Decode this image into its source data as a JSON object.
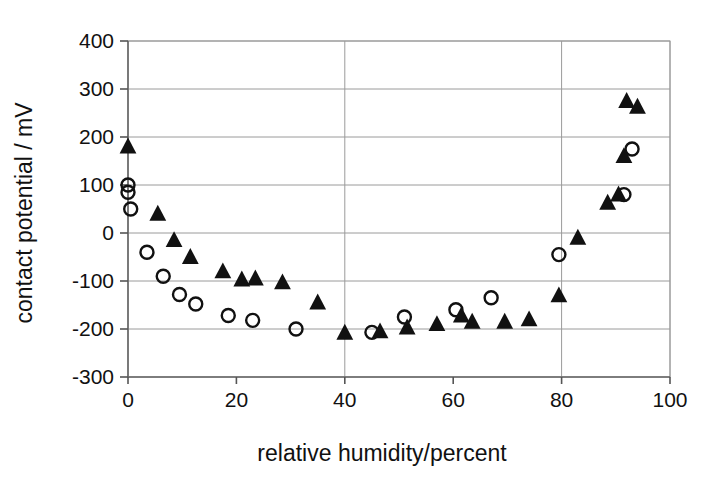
{
  "chart_data": {
    "type": "scatter",
    "title": "",
    "xlabel": "relative humidity/percent",
    "ylabel": "contact potential / mV",
    "xlim": [
      0,
      100
    ],
    "ylim": [
      -300,
      400
    ],
    "xticks": [
      0,
      20,
      40,
      60,
      80,
      100
    ],
    "yticks": [
      -300,
      -200,
      -100,
      0,
      100,
      200,
      300,
      400
    ],
    "xtick_labels": [
      "0",
      "20",
      "40",
      "60",
      "80",
      "100"
    ],
    "ytick_labels": [
      "-300",
      "-200",
      "-100",
      "0",
      "100",
      "200",
      "300",
      "400"
    ],
    "grid": true,
    "grid_axis": "y",
    "legend": "none",
    "legend_position": "none",
    "annotations": [],
    "series": [
      {
        "name": "open-circles",
        "marker": "open-circle",
        "marker_size": 13,
        "color": "#111111",
        "points": [
          {
            "x": 0.0,
            "y": 100
          },
          {
            "x": 0.0,
            "y": 85
          },
          {
            "x": 0.5,
            "y": 50
          },
          {
            "x": 3.5,
            "y": -40
          },
          {
            "x": 6.5,
            "y": -90
          },
          {
            "x": 9.5,
            "y": -128
          },
          {
            "x": 12.5,
            "y": -148
          },
          {
            "x": 18.5,
            "y": -172
          },
          {
            "x": 23.0,
            "y": -182
          },
          {
            "x": 31.0,
            "y": -200
          },
          {
            "x": 45.0,
            "y": -207
          },
          {
            "x": 51.0,
            "y": -175
          },
          {
            "x": 60.5,
            "y": -160
          },
          {
            "x": 67.0,
            "y": -135
          },
          {
            "x": 79.5,
            "y": -45
          },
          {
            "x": 91.5,
            "y": 80
          },
          {
            "x": 93.0,
            "y": 175
          }
        ]
      },
      {
        "name": "filled-triangles",
        "marker": "filled-triangle",
        "marker_size": 15,
        "color": "#111111",
        "points": [
          {
            "x": 0.0,
            "y": 180
          },
          {
            "x": 5.5,
            "y": 40
          },
          {
            "x": 8.5,
            "y": -15
          },
          {
            "x": 11.5,
            "y": -50
          },
          {
            "x": 17.5,
            "y": -80
          },
          {
            "x": 21.0,
            "y": -97
          },
          {
            "x": 23.5,
            "y": -95
          },
          {
            "x": 28.5,
            "y": -103
          },
          {
            "x": 35.0,
            "y": -145
          },
          {
            "x": 40.0,
            "y": -208
          },
          {
            "x": 46.5,
            "y": -205
          },
          {
            "x": 51.5,
            "y": -197
          },
          {
            "x": 57.0,
            "y": -190
          },
          {
            "x": 61.5,
            "y": -172
          },
          {
            "x": 63.5,
            "y": -185
          },
          {
            "x": 69.5,
            "y": -185
          },
          {
            "x": 74.0,
            "y": -180
          },
          {
            "x": 79.5,
            "y": -130
          },
          {
            "x": 83.0,
            "y": -10
          },
          {
            "x": 88.5,
            "y": 63
          },
          {
            "x": 90.5,
            "y": 80
          },
          {
            "x": 91.5,
            "y": 160
          },
          {
            "x": 92.0,
            "y": 275
          },
          {
            "x": 94.0,
            "y": 263
          }
        ]
      }
    ]
  }
}
